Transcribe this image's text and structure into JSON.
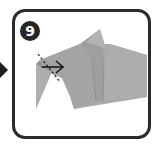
{
  "step": {
    "number": "9",
    "badge_color": "#262626",
    "frame_color": "#2b2b2b"
  },
  "diagram": {
    "paper_color": "#a8a8a8",
    "paper_shade": "#9c9c9c",
    "paper_light": "#b4b4b4",
    "fold_marker": {
      "type": "valley-fold-line",
      "arrow_direction": "right",
      "arrow_icon": "right-arrow-icon"
    }
  },
  "navigation": {
    "prev_indicator_icon": "step-pointer-arrow-icon"
  }
}
